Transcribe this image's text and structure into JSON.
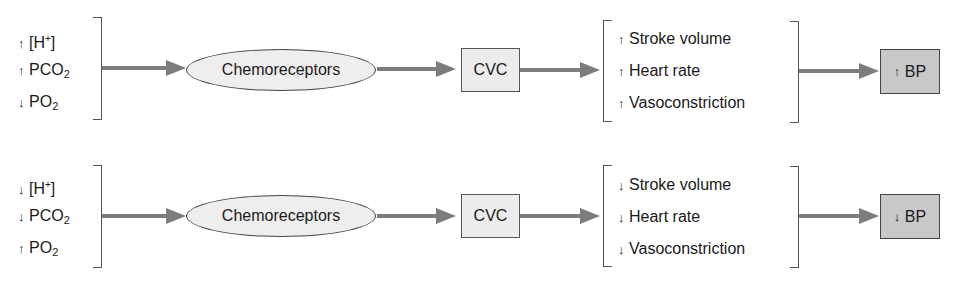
{
  "diagram": {
    "rows": [
      {
        "stimuli": [
          {
            "arrow": "↑",
            "text": "[H",
            "sup": "+",
            "suffix": "]"
          },
          {
            "arrow": "↑",
            "text": "PCO",
            "sub": "2"
          },
          {
            "arrow": "↓",
            "text": "PO",
            "sub": "2"
          }
        ],
        "receptor": "Chemoreceptors",
        "center": "CVC",
        "effects": [
          {
            "arrow": "↑",
            "text": "Stroke volume"
          },
          {
            "arrow": "↑",
            "text": "Heart rate"
          },
          {
            "arrow": "↑",
            "text": "Vasoconstriction"
          }
        ],
        "outcome": {
          "arrow": "↑",
          "text": "BP"
        }
      },
      {
        "stimuli": [
          {
            "arrow": "↓",
            "text": "[H",
            "sup": "+",
            "suffix": "]"
          },
          {
            "arrow": "↓",
            "text": "PCO",
            "sub": "2"
          },
          {
            "arrow": "↑",
            "text": "PO",
            "sub": "2"
          }
        ],
        "receptor": "Chemoreceptors",
        "center": "CVC",
        "effects": [
          {
            "arrow": "↓",
            "text": "Stroke volume"
          },
          {
            "arrow": "↓",
            "text": "Heart rate"
          },
          {
            "arrow": "↓",
            "text": "Vasoconstriction"
          }
        ],
        "outcome": {
          "arrow": "↓",
          "text": "BP"
        }
      }
    ],
    "colors": {
      "arrow": "#7d7d7d",
      "ellipse_fill": "#eeeeee",
      "box_fill": "#ececec",
      "outcome_fill": "#c8c8c8"
    }
  }
}
